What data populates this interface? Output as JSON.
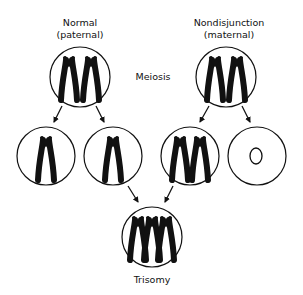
{
  "diagram": {
    "labels": {
      "normal_line1": "Normal",
      "normal_line2": "(paternal)",
      "nondisjunction_line1": "Nondisjunction",
      "nondisjunction_line2": "(maternal)",
      "meiosis": "Meiosis",
      "trisomy": "Trisomy"
    },
    "cells": [
      {
        "id": "paternal-parent-cell",
        "chromosomes": 2
      },
      {
        "id": "maternal-parent-cell",
        "chromosomes": 2
      },
      {
        "id": "paternal-gamete-1",
        "chromosomes": 1
      },
      {
        "id": "paternal-gamete-2",
        "chromosomes": 1
      },
      {
        "id": "maternal-gamete-disomic",
        "chromosomes": 2
      },
      {
        "id": "maternal-gamete-nullisomic",
        "chromosomes": 0
      },
      {
        "id": "trisomic-zygote",
        "chromosomes": 3
      }
    ],
    "colors": {
      "ink": "#111111",
      "background": "#ffffff"
    }
  }
}
